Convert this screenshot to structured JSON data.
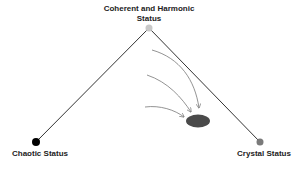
{
  "diagram": {
    "nodes": {
      "top": {
        "label": "Coherent and Harmonic Status",
        "color": "#c8c8c8"
      },
      "left": {
        "label": "Chaotic Status",
        "color": "#000000"
      },
      "right": {
        "label": "Crystal Status",
        "color": "#7a7a7a"
      }
    },
    "target": {
      "color": "#4a4a4a"
    },
    "line_color": "#333333",
    "arrow_color": "#777777",
    "arrow_count": 4
  }
}
